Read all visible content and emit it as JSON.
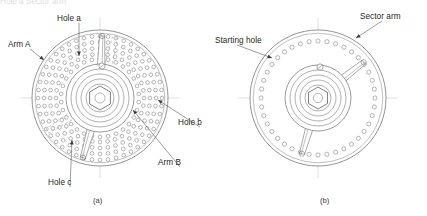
{
  "figure": {
    "background_color": "#ffffff",
    "line_color": "#6f6f6f",
    "heavy_line_color": "#3b3b3b",
    "center_line_color": "#bdbdbd",
    "text_color": "#231f20",
    "panels": [
      {
        "id": "panel-a",
        "caption": "(a)",
        "caption_x": 93,
        "caption_y": 198,
        "description": "Dividing head index plate with multiple concentric rings of holes and two sector arms",
        "center": {
          "x": 100,
          "y": 98
        },
        "plate_radius": 68,
        "hub_rings": [
          34,
          29,
          24,
          19,
          14,
          10
        ],
        "hex_radius": 12,
        "hole_rings": [
          {
            "radius": 62,
            "count": 48
          },
          {
            "radius": 56,
            "count": 44
          },
          {
            "radius": 50,
            "count": 40
          },
          {
            "radius": 44,
            "count": 36
          },
          {
            "radius": 39,
            "count": 30
          }
        ],
        "arms": [
          {
            "name": "arm-a",
            "angle_deg": 196,
            "length": 62,
            "style": "solid"
          },
          {
            "name": "arm-b",
            "angle_deg": 2,
            "length": 62,
            "style": "solid"
          },
          {
            "name": "arm-b-phantom",
            "angle_deg": 14,
            "length": 62,
            "style": "dashed"
          },
          {
            "name": "arm-c-phantom",
            "angle_deg": 238,
            "length": 62,
            "style": "dashed"
          }
        ],
        "labels": [
          {
            "name": "hole-a-label",
            "text": "Hole a",
            "x": 57,
            "y": 14,
            "leader_to_x": 79,
            "leader_to_y": 56
          },
          {
            "name": "arm-a-label",
            "text": "Arm A",
            "x": 8,
            "y": 40,
            "leader_to_x": 44,
            "leader_to_y": 60
          },
          {
            "name": "hole-b-label",
            "text": "Hole b",
            "x": 178,
            "y": 118,
            "leader_to_x": 158,
            "leader_to_y": 100
          },
          {
            "name": "arm-b-label",
            "text": "Arm B",
            "x": 158,
            "y": 158,
            "leader_to_x": 133,
            "leader_to_y": 110
          },
          {
            "name": "hole-c-label",
            "text": "Hole c",
            "x": 48,
            "y": 178,
            "leader_to_x": 72,
            "leader_to_y": 140
          }
        ]
      },
      {
        "id": "panel-b",
        "caption": "(b)",
        "caption_x": 320,
        "caption_y": 198,
        "description": "Index plate with a single ring of holes and a sector arm pair",
        "center": {
          "x": 318,
          "y": 98
        },
        "plate_radius": 68,
        "hub_rings": [
          33,
          28,
          23,
          18,
          13
        ],
        "hex_radius": 11,
        "hole_rings": [
          {
            "radius": 57,
            "count": 40
          }
        ],
        "arms": [
          {
            "name": "starting-arm",
            "angle_deg": 196,
            "length": 58,
            "style": "solid"
          },
          {
            "name": "sector-arm",
            "angle_deg": 52,
            "length": 58,
            "style": "solid"
          }
        ],
        "labels": [
          {
            "name": "starting-hole-label",
            "text": "Starting hole",
            "x": 215,
            "y": 36,
            "leader_to_x": 272,
            "leader_to_y": 58
          },
          {
            "name": "sector-arm-label",
            "text": "Sector arm",
            "x": 360,
            "y": 12,
            "leader_to_x": 356,
            "leader_to_y": 38
          }
        ]
      }
    ]
  },
  "ghost_top_text": "Hole a                                        Sector arm"
}
